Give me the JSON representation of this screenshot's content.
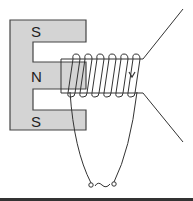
{
  "diagram": {
    "magnet": {
      "poles": [
        {
          "label": "S",
          "position": "top"
        },
        {
          "label": "N",
          "position": "middle"
        },
        {
          "label": "S",
          "position": "bottom"
        }
      ],
      "fill_color": "#d4d4d4",
      "stroke_color": "#444444"
    },
    "coil": {
      "turns": 6,
      "current_direction": "down"
    },
    "input": {
      "symbol": "~"
    },
    "colors": {
      "line": "#333333",
      "background": "#ffffff"
    }
  }
}
